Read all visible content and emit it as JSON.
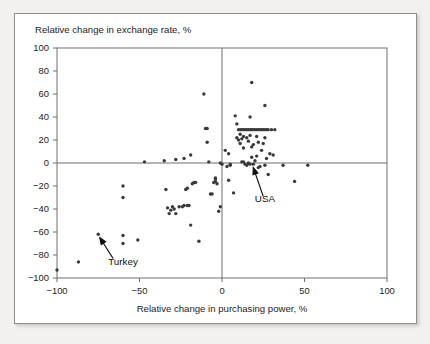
{
  "figure": {
    "background_color": "#f2f1ef",
    "panel_color": "#ffffff",
    "frame_color": "#8e8e8e"
  },
  "chart_data": {
    "type": "scatter",
    "title": "",
    "xlabel": "Relative change in purchasing power, %",
    "ylabel": "Relative change in exchange rate, %",
    "xlim": [
      -100,
      100
    ],
    "ylim": [
      -100,
      100
    ],
    "xticks": [
      -100,
      -50,
      0,
      50,
      100
    ],
    "yticks": [
      -100,
      -80,
      -60,
      -40,
      -20,
      0,
      20,
      40,
      60,
      80,
      100
    ],
    "xtick_labels": [
      "−100",
      "−50",
      "0",
      "50",
      "100"
    ],
    "ytick_labels": [
      "−100",
      "−80",
      "−60",
      "−40",
      "−20",
      "0",
      "20",
      "40",
      "60",
      "80",
      "100"
    ],
    "grid": false,
    "legend": null,
    "zero_lines": {
      "x": 0,
      "y": 0
    },
    "marker_color": "#3a3a3a",
    "points": [
      [
        -100,
        -93
      ],
      [
        -87,
        -86
      ],
      [
        -75,
        -62
      ],
      [
        -60,
        -63
      ],
      [
        -60,
        -70
      ],
      [
        -51,
        -67
      ],
      [
        -60,
        -20
      ],
      [
        -60,
        -30
      ],
      [
        -47,
        1
      ],
      [
        -34,
        -23
      ],
      [
        -33,
        -39
      ],
      [
        -32,
        -44
      ],
      [
        -31,
        -41
      ],
      [
        -30,
        -38
      ],
      [
        -29,
        -40
      ],
      [
        -28,
        -44
      ],
      [
        -26,
        -38
      ],
      [
        -24,
        -38
      ],
      [
        -23,
        -37
      ],
      [
        -22,
        -23
      ],
      [
        -21,
        -22
      ],
      [
        -21,
        -37
      ],
      [
        -20,
        -37
      ],
      [
        -19,
        -54
      ],
      [
        -18,
        -18
      ],
      [
        -17,
        -17
      ],
      [
        -16,
        -17
      ],
      [
        -35,
        2
      ],
      [
        -28,
        3
      ],
      [
        -23,
        4
      ],
      [
        -19,
        7
      ],
      [
        -14,
        -68
      ],
      [
        -11,
        60
      ],
      [
        -10,
        30
      ],
      [
        -9,
        30
      ],
      [
        -9,
        18
      ],
      [
        -8,
        1
      ],
      [
        -7,
        -27
      ],
      [
        -6,
        -27
      ],
      [
        -5,
        -17
      ],
      [
        -4,
        -16
      ],
      [
        -4,
        -14
      ],
      [
        -4,
        -13
      ],
      [
        -3,
        -18
      ],
      [
        -2,
        -42
      ],
      [
        -1,
        -38
      ],
      [
        -1,
        0
      ],
      [
        0,
        -1
      ],
      [
        2,
        11
      ],
      [
        3,
        -3
      ],
      [
        4,
        -15
      ],
      [
        4,
        8
      ],
      [
        5,
        -2
      ],
      [
        5,
        -1
      ],
      [
        7,
        -26
      ],
      [
        8,
        41
      ],
      [
        9,
        34
      ],
      [
        9,
        22
      ],
      [
        10,
        29
      ],
      [
        10,
        20
      ],
      [
        11,
        29
      ],
      [
        11,
        17
      ],
      [
        11,
        25
      ],
      [
        12,
        29
      ],
      [
        12,
        21
      ],
      [
        12,
        1
      ],
      [
        13,
        29
      ],
      [
        13,
        23
      ],
      [
        13,
        13
      ],
      [
        13,
        1
      ],
      [
        14,
        29
      ],
      [
        14,
        -1
      ],
      [
        15,
        29
      ],
      [
        15,
        22
      ],
      [
        15,
        -2
      ],
      [
        16,
        29
      ],
      [
        16,
        19
      ],
      [
        16,
        0
      ],
      [
        17,
        40
      ],
      [
        17,
        29
      ],
      [
        17,
        24
      ],
      [
        17,
        -1
      ],
      [
        18,
        70
      ],
      [
        18,
        29
      ],
      [
        18,
        14
      ],
      [
        18,
        5
      ],
      [
        19,
        29
      ],
      [
        19,
        16
      ],
      [
        19,
        -1
      ],
      [
        20,
        29
      ],
      [
        20,
        2
      ],
      [
        20,
        -8
      ],
      [
        21,
        29
      ],
      [
        21,
        23
      ],
      [
        21,
        6
      ],
      [
        22,
        29
      ],
      [
        22,
        18
      ],
      [
        22,
        -4
      ],
      [
        23,
        29
      ],
      [
        23,
        -3
      ],
      [
        24,
        29
      ],
      [
        24,
        11
      ],
      [
        25,
        29
      ],
      [
        25,
        17
      ],
      [
        26,
        50
      ],
      [
        26,
        29
      ],
      [
        26,
        22
      ],
      [
        26,
        -2
      ],
      [
        27,
        29
      ],
      [
        27,
        4
      ],
      [
        28,
        29
      ],
      [
        28,
        -10
      ],
      [
        29,
        8
      ],
      [
        30,
        29
      ],
      [
        31,
        7
      ],
      [
        32,
        29
      ],
      [
        37,
        -2
      ],
      [
        44,
        -16
      ],
      [
        52,
        -2
      ]
    ],
    "annotations": [
      {
        "label": "Turkey",
        "point": [
          -75,
          -62
        ],
        "label_x": -60,
        "label_y": -89,
        "arrow_from": [
          -66,
          -83
        ],
        "arrow_to": [
          -74,
          -65
        ]
      },
      {
        "label": "USA",
        "point": [
          18,
          -2
        ],
        "label_x": 26,
        "label_y": -34,
        "arrow_from": [
          25,
          -29
        ],
        "arrow_to": [
          19,
          -4
        ]
      }
    ]
  }
}
